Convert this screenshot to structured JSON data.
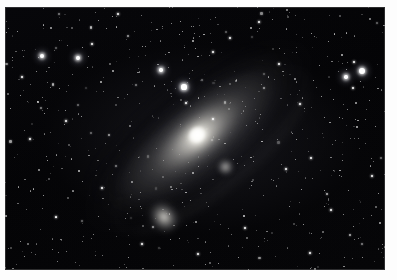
{
  "photo": {
    "subject": "Andromeda Galaxy",
    "frame_width": 397,
    "frame_height": 280,
    "border_color": "#fdfdfd",
    "sky_color": "#050507",
    "plate": {
      "x": 5,
      "y": 7,
      "width": 380,
      "height": 263
    }
  },
  "objects": [
    {
      "name": "M31 Andromeda Galaxy",
      "type": "spiral-galaxy",
      "cx": 196,
      "cy": 140,
      "major_axis_px": 250,
      "minor_axis_px": 96,
      "position_angle_deg": -39,
      "core_color": "#fffffc"
    },
    {
      "name": "M110 companion galaxy",
      "type": "elliptical-galaxy",
      "cx": 159,
      "cy": 210,
      "size_px": 42,
      "core_color": "#f0eee8"
    },
    {
      "name": "M32 companion galaxy",
      "type": "elliptical-galaxy",
      "cx": 220,
      "cy": 160,
      "size_px": 17,
      "core_color": "#ebe9e4"
    }
  ],
  "bright_stars": [
    {
      "x": 362,
      "y": 71,
      "r": 3.0,
      "mag_class": "bright"
    },
    {
      "x": 184,
      "y": 87,
      "r": 2.6,
      "mag_class": "bright"
    },
    {
      "x": 42,
      "y": 56,
      "r": 2.1,
      "mag_class": "bright"
    },
    {
      "x": 78,
      "y": 58,
      "r": 1.9,
      "mag_class": "bright"
    },
    {
      "x": 346,
      "y": 77,
      "r": 1.7,
      "mag_class": "bright"
    },
    {
      "x": 161,
      "y": 70,
      "r": 1.7,
      "mag_class": "bright"
    },
    {
      "x": 354,
      "y": 62,
      "r": 1.2,
      "mag_class": "medium"
    },
    {
      "x": 353,
      "y": 88,
      "r": 1.2,
      "mag_class": "medium"
    },
    {
      "x": 118,
      "y": 14,
      "r": 1.4,
      "mag_class": "medium"
    },
    {
      "x": 259,
      "y": 22,
      "r": 1.3,
      "mag_class": "medium"
    },
    {
      "x": 213,
      "y": 52,
      "r": 1.3,
      "mag_class": "medium"
    },
    {
      "x": 186,
      "y": 103,
      "r": 1.2,
      "mag_class": "medium"
    },
    {
      "x": 213,
      "y": 119,
      "r": 1.1,
      "mag_class": "medium"
    },
    {
      "x": 286,
      "y": 169,
      "r": 1.3,
      "mag_class": "medium"
    },
    {
      "x": 311,
      "y": 158,
      "r": 1.2,
      "mag_class": "medium"
    },
    {
      "x": 102,
      "y": 188,
      "r": 1.2,
      "mag_class": "medium"
    },
    {
      "x": 56,
      "y": 217,
      "r": 1.3,
      "mag_class": "medium"
    },
    {
      "x": 245,
      "y": 228,
      "r": 1.3,
      "mag_class": "medium"
    },
    {
      "x": 331,
      "y": 210,
      "r": 1.2,
      "mag_class": "medium"
    },
    {
      "x": 30,
      "y": 139,
      "r": 1.2,
      "mag_class": "medium"
    },
    {
      "x": 66,
      "y": 121,
      "r": 1.1,
      "mag_class": "medium"
    },
    {
      "x": 279,
      "y": 64,
      "r": 1.2,
      "mag_class": "medium"
    },
    {
      "x": 142,
      "y": 244,
      "r": 1.2,
      "mag_class": "medium"
    },
    {
      "x": 198,
      "y": 254,
      "r": 1.1,
      "mag_class": "medium"
    },
    {
      "x": 310,
      "y": 253,
      "r": 1.1,
      "mag_class": "medium"
    },
    {
      "x": 372,
      "y": 176,
      "r": 1.1,
      "mag_class": "medium"
    },
    {
      "x": 22,
      "y": 77,
      "r": 1.1,
      "mag_class": "medium"
    },
    {
      "x": 92,
      "y": 44,
      "r": 1.0,
      "mag_class": "medium"
    },
    {
      "x": 230,
      "y": 38,
      "r": 1.0,
      "mag_class": "medium"
    },
    {
      "x": 300,
      "y": 104,
      "r": 1.0,
      "mag_class": "medium"
    }
  ],
  "starfield": {
    "faint_star_count": 620,
    "seed": 1337,
    "color": "#ffffff"
  }
}
